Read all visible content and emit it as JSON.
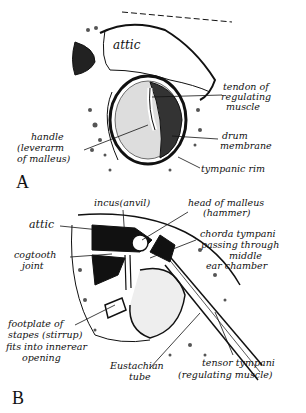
{
  "figure_a": {
    "letter": "A",
    "labels": {
      "attic": "attic",
      "tendon_1": "tendon of",
      "tendon_2": "regulating",
      "tendon_3": "muscle",
      "drum_1": "drum",
      "drum_2": "membrane",
      "rim": "tympanic rim",
      "handle_1": "handle",
      "handle_2": "(leverarm",
      "handle_3": "of malleus)"
    }
  },
  "figure_b": {
    "letter": "B",
    "labels": {
      "incus": "incus(anvil)",
      "head_1": "head of malleus",
      "head_2": "(hammer)",
      "attic": "attic",
      "chorda_1": "chorda tympani",
      "chorda_2": "passing through",
      "chorda_3": "middle",
      "chorda_4": "ear chamber",
      "cog_1": "cogtooth",
      "cog_2": "joint",
      "foot_1": "footplate of",
      "foot_2": "stapes (stirrup)",
      "foot_3": "fits into innerear",
      "foot_4": "opening",
      "eust_1": "Eustachian",
      "eust_2": "tube",
      "tensor_1": "tensor tympani",
      "tensor_2": "(regulating muscle)"
    }
  }
}
